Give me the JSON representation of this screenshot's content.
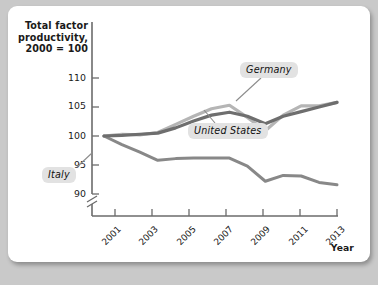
{
  "chart_data": {
    "type": "line",
    "title": "Total factor productivity, 2000 = 100",
    "ylabel": "Total factor productivity,\n2000 = 100",
    "xlabel": "Year",
    "x": [
      2000,
      2001,
      2002,
      2003,
      2004,
      2005,
      2006,
      2007,
      2008,
      2009,
      2010,
      2011,
      2012,
      2013
    ],
    "xlim": [
      2000,
      2013
    ],
    "ylim": [
      90,
      110
    ],
    "y_ticks": [
      90,
      95,
      100,
      105,
      110
    ],
    "x_ticks": [
      2001,
      2003,
      2005,
      2007,
      2009,
      2011,
      2013
    ],
    "y_axis_break": true,
    "grid": false,
    "legend": "inline-labels",
    "series": [
      {
        "name": "Germany",
        "color": "#b5b5b5",
        "values": [
          100.0,
          100.3,
          100.2,
          100.6,
          102.0,
          103.4,
          104.7,
          105.3,
          103.2,
          100.9,
          103.6,
          105.2,
          105.2,
          105.8
        ]
      },
      {
        "name": "United States",
        "color": "#6e6e6e",
        "values": [
          100.0,
          100.1,
          100.3,
          100.5,
          101.4,
          102.6,
          103.6,
          104.1,
          103.4,
          102.1,
          103.4,
          104.2,
          105.0,
          105.8
        ]
      },
      {
        "name": "Italy",
        "color": "#888888",
        "values": [
          100.0,
          98.5,
          97.2,
          95.8,
          96.1,
          96.2,
          96.2,
          96.2,
          94.8,
          92.2,
          93.2,
          93.1,
          92.0,
          91.6
        ]
      }
    ]
  },
  "axis": {
    "y_title": [
      "Total factor",
      "productivity,",
      "2000 = 100"
    ],
    "x_title": "Year",
    "y_tick_labels": [
      "110",
      "105",
      "100",
      "95",
      "90"
    ],
    "x_tick_labels": [
      "2001",
      "2003",
      "2005",
      "2007",
      "2009",
      "2011",
      "2013"
    ]
  },
  "labels": {
    "germany": "Germany",
    "united_states": "United States",
    "italy": "Italy"
  },
  "colors": {
    "germany": "#b5b5b5",
    "united_states": "#6e6e6e",
    "italy": "#888888",
    "axis": "#6b6b6b",
    "card": "#ffffff",
    "background": "#c9c9c9",
    "label_box": "#e2e2e2"
  }
}
